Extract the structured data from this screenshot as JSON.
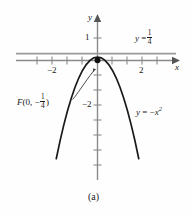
{
  "figure": {
    "caption": "(a)",
    "background_color": "#fefefe",
    "curve_color": "#1a1a1a",
    "axis_color": "#8a8a8a"
  },
  "axes": {
    "x_axis_label": "x",
    "y_axis_label": "y",
    "x_ticks": [
      {
        "value": -2,
        "label": "−2"
      },
      {
        "value": 2,
        "label": "2"
      }
    ],
    "y_ticks": [
      {
        "value": 1,
        "label": "1"
      },
      {
        "value": -2,
        "label": "−2"
      }
    ]
  },
  "annotations": {
    "focus": {
      "label_prefix": "F",
      "label_open": "(",
      "label_x": "0,",
      "label_sign": "−",
      "frac_num": "1",
      "frac_den": "4",
      "label_close": ")",
      "point_x": 0,
      "point_y": -0.25
    },
    "directrix": {
      "lhs": "y",
      "eq": "=",
      "frac_num": "1",
      "frac_den": "4",
      "y_value": 0.25
    },
    "curve_label": {
      "lhs": "y",
      "eq": "=",
      "rhs_sign": "−",
      "rhs_var": "x",
      "rhs_exp": "2"
    }
  },
  "chart_data": {
    "type": "line",
    "title": "(a)",
    "xlabel": "x",
    "ylabel": "y",
    "xlim": [
      -3.1,
      3.1
    ],
    "ylim": [
      -9.2,
      1.6
    ],
    "grid": false,
    "legend": "none",
    "series": [
      {
        "name": "y = -x^2",
        "equation": "y = -x²",
        "x": [
          -3.0,
          -2.75,
          -2.5,
          -2.25,
          -2.0,
          -1.75,
          -1.5,
          -1.25,
          -1.0,
          -0.75,
          -0.5,
          -0.25,
          0.0,
          0.25,
          0.5,
          0.75,
          1.0,
          1.25,
          1.5,
          1.75,
          2.0,
          2.25,
          2.5,
          2.75,
          3.0
        ],
        "y": [
          -9.0,
          -7.5625,
          -6.25,
          -5.0625,
          -4.0,
          -3.0625,
          -2.25,
          -1.5625,
          -1.0,
          -0.5625,
          -0.25,
          -0.0625,
          0.0,
          -0.0625,
          -0.25,
          -0.5625,
          -1.0,
          -1.5625,
          -2.25,
          -3.0625,
          -4.0,
          -5.0625,
          -6.25,
          -7.5625,
          -9.0
        ]
      },
      {
        "name": "directrix y = 1/4",
        "equation": "y = 1/4",
        "x": [
          -3.1,
          3.1
        ],
        "y": [
          0.25,
          0.25
        ]
      }
    ],
    "points": [
      {
        "name": "focus",
        "x": 0,
        "y": -0.25,
        "label": "F(0, −1/4)"
      }
    ],
    "annotations": [
      {
        "text": "y = 1/4",
        "x": 2.0,
        "y": 1.0
      },
      {
        "text": "y = −x²",
        "x": 1.85,
        "y": -2.6
      },
      {
        "text": "F(0, −1/4)",
        "x": -2.65,
        "y": -1.75
      }
    ]
  }
}
